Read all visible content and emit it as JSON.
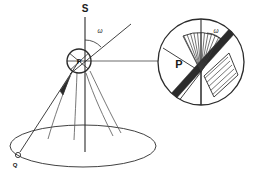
{
  "figure": {
    "kind": "geometric-diagram",
    "background_color": "#ffffff",
    "stroke_color": "#2b2b2b",
    "labels": {
      "axis_top": "S",
      "point_p_main": "P",
      "point_q": "Q",
      "point_p_inset": "P",
      "angle_main": "ω",
      "angle_inset": "ω"
    },
    "main_view": {
      "vertical_axis_label": "S",
      "apex_label": "P",
      "base_point_label": "Q",
      "angle_label": "ω"
    },
    "inset_view": {
      "center_label": "P",
      "angle_label": "ω"
    }
  }
}
